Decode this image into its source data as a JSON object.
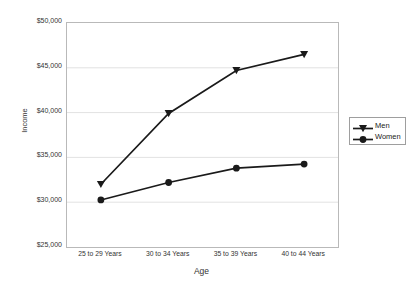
{
  "chart_data": {
    "type": "line",
    "title": "",
    "xlabel": "Age",
    "ylabel": "Income",
    "categories": [
      "25 to 29 Years",
      "30 to 34 Years",
      "35 to 39 Years",
      "40 to 44 Years"
    ],
    "ylim": [
      25000,
      50000
    ],
    "ytick_step": 5000,
    "ytick_labels": [
      "$50,000",
      "$45,000",
      "$40,000",
      "$35,000",
      "$30,000",
      "$25,000"
    ],
    "ytick_values": [
      50000,
      45000,
      40000,
      35000,
      30000,
      25000
    ],
    "grid": true,
    "legend_position": "right",
    "series": [
      {
        "name": "Men",
        "marker": "triangle",
        "color": "#1a1a1a",
        "values": [
          32000,
          39900,
          44700,
          46500
        ]
      },
      {
        "name": "Women",
        "marker": "circle",
        "color": "#1a1a1a",
        "values": [
          30250,
          32200,
          33800,
          34250
        ]
      }
    ]
  },
  "legend": {
    "items": [
      {
        "label": "Men"
      },
      {
        "label": "Women"
      }
    ]
  },
  "axes": {
    "x_title": "Age",
    "y_title": "Income"
  }
}
